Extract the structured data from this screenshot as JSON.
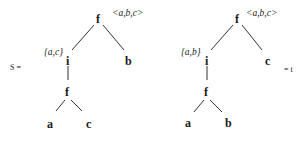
{
  "diagram": {
    "type": "tree-pair",
    "left_equation_label": "S =",
    "right_equation_label": "= t",
    "trees": [
      {
        "name": "S",
        "root": {
          "label": "f",
          "annotation": "<a,b,c>",
          "children": [
            {
              "label": "i",
              "annotation": "{a,c}",
              "children": [
                {
                  "label": "f",
                  "children": [
                    {
                      "label": "a"
                    },
                    {
                      "label": "c"
                    }
                  ]
                }
              ]
            },
            {
              "label": "b"
            }
          ]
        }
      },
      {
        "name": "t",
        "root": {
          "label": "f",
          "annotation": "<a,b,c>",
          "children": [
            {
              "label": "i",
              "annotation": "{a,b}",
              "children": [
                {
                  "label": "f",
                  "children": [
                    {
                      "label": "a"
                    },
                    {
                      "label": "b"
                    }
                  ]
                }
              ]
            },
            {
              "label": "c"
            }
          ]
        }
      }
    ]
  },
  "text": {
    "s_eq": "S =",
    "t_eq": "= t",
    "left": {
      "root": "f",
      "root_ann": "<a,b,c>",
      "i": "i",
      "i_ann": "{a,c}",
      "right_leaf": "b",
      "f2": "f",
      "leaf1": "a",
      "leaf2": "c"
    },
    "right": {
      "root": "f",
      "root_ann": "<a,b,c>",
      "i": "i",
      "i_ann": "{a,b}",
      "right_leaf": "c",
      "f2": "f",
      "leaf1": "a",
      "leaf2": "b"
    }
  }
}
